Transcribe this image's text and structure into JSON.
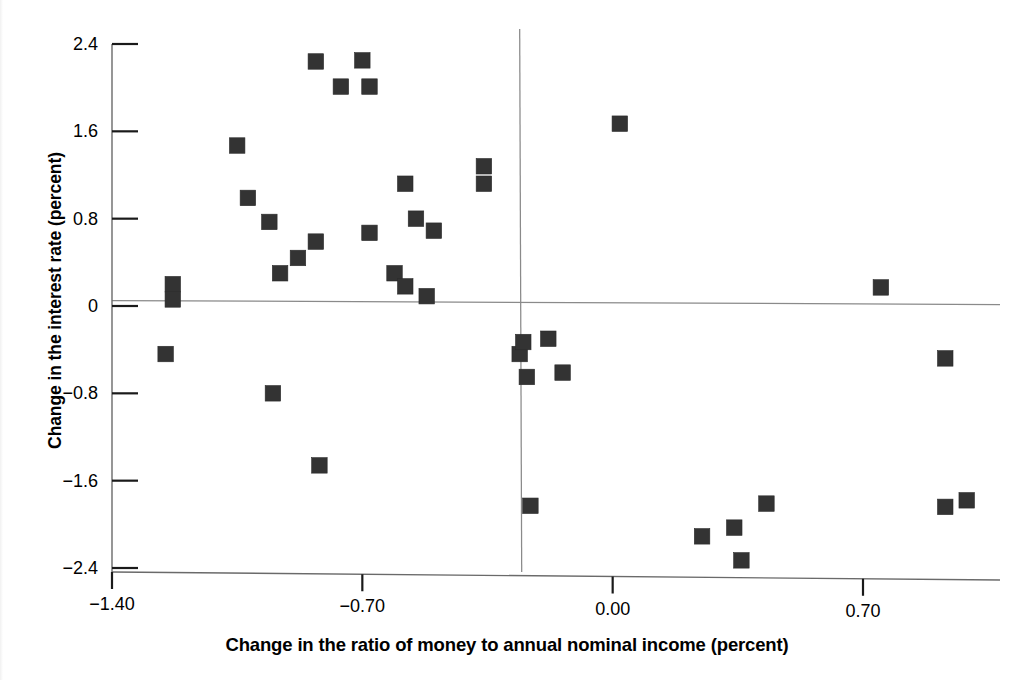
{
  "chart_data": {
    "type": "scatter",
    "title": "",
    "xlabel": "Change in the ratio of money to annual nominal income (percent)",
    "ylabel": "Change in the interest rate (percent)",
    "xlim": [
      -1.45,
      1.05
    ],
    "ylim": [
      -2.45,
      2.5
    ],
    "xticks": [
      "-1.40",
      "-0.70",
      "0.00",
      "0.70"
    ],
    "xtick_values": [
      -1.4,
      -0.7,
      0.0,
      0.7
    ],
    "yticks": [
      "2.4",
      "1.6",
      "0.8",
      "0",
      "-0.8",
      "-1.6",
      "-2.4"
    ],
    "ytick_values": [
      2.4,
      1.6,
      0.8,
      0,
      -0.8,
      -1.6,
      -2.4
    ],
    "grid": false,
    "legend": null,
    "marker": "filled-square",
    "marker_color": "#333333",
    "reference_lines": [
      {
        "orientation": "horizontal",
        "value": 0.05,
        "color": "#8a8a8a"
      },
      {
        "orientation": "vertical",
        "value": -0.26,
        "color": "#8a8a8a"
      }
    ],
    "points": [
      {
        "x": -1.23,
        "y": 0.2
      },
      {
        "x": -1.23,
        "y": 0.06
      },
      {
        "x": -1.25,
        "y": -0.44
      },
      {
        "x": -1.05,
        "y": 1.47
      },
      {
        "x": -1.02,
        "y": 0.99
      },
      {
        "x": -0.96,
        "y": 0.77
      },
      {
        "x": -0.95,
        "y": -0.8
      },
      {
        "x": -0.93,
        "y": 0.3
      },
      {
        "x": -0.88,
        "y": 0.44
      },
      {
        "x": -0.83,
        "y": 2.24
      },
      {
        "x": -0.83,
        "y": 0.59
      },
      {
        "x": -0.82,
        "y": -1.46
      },
      {
        "x": -0.76,
        "y": 2.01
      },
      {
        "x": -0.7,
        "y": 2.25
      },
      {
        "x": -0.68,
        "y": 2.01
      },
      {
        "x": -0.68,
        "y": 0.67
      },
      {
        "x": -0.61,
        "y": 0.3
      },
      {
        "x": -0.58,
        "y": 1.12
      },
      {
        "x": -0.58,
        "y": 0.18
      },
      {
        "x": -0.55,
        "y": 0.8
      },
      {
        "x": -0.52,
        "y": 0.09
      },
      {
        "x": -0.5,
        "y": 0.69
      },
      {
        "x": -0.36,
        "y": 1.28
      },
      {
        "x": -0.36,
        "y": 1.12
      },
      {
        "x": -0.26,
        "y": -0.44
      },
      {
        "x": -0.25,
        "y": -0.33
      },
      {
        "x": -0.24,
        "y": -0.65
      },
      {
        "x": -0.23,
        "y": -1.83
      },
      {
        "x": -0.18,
        "y": -0.3
      },
      {
        "x": -0.14,
        "y": -0.61
      },
      {
        "x": 0.02,
        "y": 1.67
      },
      {
        "x": 0.25,
        "y": -2.11
      },
      {
        "x": 0.34,
        "y": -2.03
      },
      {
        "x": 0.36,
        "y": -2.33
      },
      {
        "x": 0.43,
        "y": -1.81
      },
      {
        "x": 0.75,
        "y": 0.17
      },
      {
        "x": 0.93,
        "y": -0.48
      },
      {
        "x": 0.93,
        "y": -1.84
      },
      {
        "x": 0.99,
        "y": -1.78
      }
    ]
  }
}
